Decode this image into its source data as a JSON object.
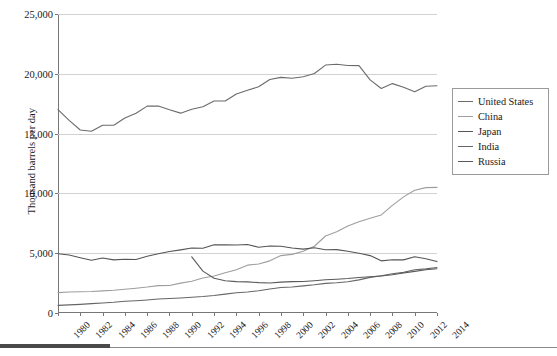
{
  "chart_data": {
    "type": "line",
    "title": "",
    "xlabel": "",
    "ylabel": "Thousand barrels per day",
    "ylim": [
      0,
      25000
    ],
    "xlim": [
      1980,
      2014
    ],
    "grid": true,
    "legend_position": "right",
    "y_ticks": [
      "0",
      "5,000",
      "10,000",
      "15,000",
      "20,000",
      "25,000"
    ],
    "y_tick_values": [
      0,
      5000,
      10000,
      15000,
      20000,
      25000
    ],
    "x_ticks": [
      "1980",
      "1982",
      "1984",
      "1986",
      "1988",
      "1990",
      "1992",
      "1994",
      "1996",
      "1998",
      "2000",
      "2002",
      "2004",
      "2006",
      "2008",
      "2010",
      "2012",
      "2014"
    ],
    "x": [
      1980,
      1981,
      1982,
      1983,
      1984,
      1985,
      1986,
      1987,
      1988,
      1989,
      1990,
      1991,
      1992,
      1993,
      1994,
      1995,
      1996,
      1997,
      1998,
      1999,
      2000,
      2001,
      2002,
      2003,
      2004,
      2005,
      2006,
      2007,
      2008,
      2009,
      2010,
      2011,
      2012,
      2013,
      2014
    ],
    "series": [
      {
        "name": "United States",
        "color": "#6b6b6b",
        "values": [
          17000,
          16100,
          15300,
          15200,
          15700,
          15700,
          16300,
          16700,
          17300,
          17300,
          16990,
          16710,
          17030,
          17240,
          17720,
          17720,
          18310,
          18620,
          18920,
          19520,
          19700,
          19630,
          19760,
          20030,
          20730,
          20800,
          20690,
          20680,
          19490,
          18770,
          19180,
          18880,
          18490,
          18960,
          19000
        ]
      },
      {
        "name": "China",
        "color": "#9e9e9e",
        "values": [
          1700,
          1750,
          1780,
          1800,
          1850,
          1900,
          1990,
          2070,
          2170,
          2290,
          2300,
          2500,
          2660,
          2930,
          3090,
          3360,
          3610,
          4000,
          4100,
          4360,
          4800,
          4900,
          5160,
          5580,
          6440,
          6790,
          7270,
          7630,
          7930,
          8200,
          9000,
          9710,
          10270,
          10480,
          10500
        ]
      },
      {
        "name": "Japan",
        "color": "#555555",
        "values": [
          4960,
          4850,
          4620,
          4410,
          4600,
          4440,
          4500,
          4470,
          4750,
          4960,
          5140,
          5280,
          5440,
          5410,
          5700,
          5710,
          5680,
          5730,
          5500,
          5600,
          5580,
          5430,
          5340,
          5450,
          5290,
          5300,
          5160,
          5000,
          4800,
          4360,
          4450,
          4440,
          4700,
          4530,
          4300
        ]
      },
      {
        "name": "India",
        "color": "#666666",
        "values": [
          640,
          680,
          720,
          780,
          840,
          900,
          980,
          1030,
          1090,
          1170,
          1210,
          1260,
          1320,
          1380,
          1460,
          1580,
          1690,
          1760,
          1860,
          2000,
          2130,
          2180,
          2270,
          2360,
          2480,
          2530,
          2610,
          2770,
          2980,
          3120,
          3280,
          3400,
          3610,
          3690,
          3800
        ]
      },
      {
        "name": "Russia",
        "color": "#5a5a5a",
        "values": [
          null,
          null,
          null,
          null,
          null,
          null,
          null,
          null,
          null,
          null,
          null,
          null,
          4700,
          3500,
          2900,
          2700,
          2620,
          2600,
          2540,
          2510,
          2580,
          2620,
          2640,
          2700,
          2780,
          2820,
          2880,
          2970,
          3030,
          3090,
          3200,
          3340,
          3480,
          3620,
          3700
        ]
      }
    ]
  },
  "legend": {
    "items": [
      {
        "label": "United States"
      },
      {
        "label": "China"
      },
      {
        "label": "Japan"
      },
      {
        "label": "India"
      },
      {
        "label": "Russia"
      }
    ]
  }
}
